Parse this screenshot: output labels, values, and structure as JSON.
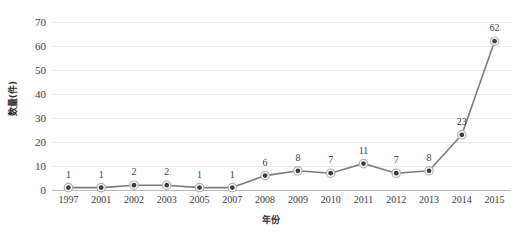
{
  "chart_data": {
    "type": "line",
    "title": "",
    "xlabel": "年份",
    "ylabel": "数量(件)",
    "categories": [
      "1997",
      "2001",
      "2002",
      "2003",
      "2005",
      "2007",
      "2008",
      "2009",
      "2010",
      "2011",
      "2012",
      "2013",
      "2014",
      "2015"
    ],
    "values": [
      1,
      1,
      2,
      2,
      1,
      1,
      6,
      8,
      7,
      11,
      7,
      8,
      23,
      62
    ],
    "data_labels": [
      "1",
      "1",
      "2",
      "2",
      "1",
      "1",
      "6",
      "8",
      "7",
      "11",
      "7",
      "8",
      "23",
      "62"
    ],
    "ylim": [
      0,
      70
    ],
    "ytick_step": 10,
    "yticks": [
      "70",
      "60",
      "50",
      "40",
      "30",
      "20",
      "10",
      "0"
    ],
    "ytick_values": [
      70,
      60,
      50,
      40,
      30,
      20,
      10,
      0
    ],
    "grid": true,
    "legend": false,
    "legend_position": "none",
    "marker": "circle",
    "colors": {
      "line": "#7a7a7a",
      "marker_fill": "#3d3d3d",
      "marker_ring": "#b0b0b0",
      "gridline": "#e9e9e9",
      "axis": "#b9b9b9",
      "text": "#3b3b3b",
      "background": "#ffffff"
    }
  }
}
